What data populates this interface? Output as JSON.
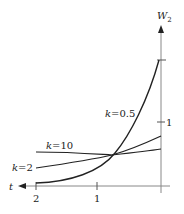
{
  "figure": {
    "y_axis_label": "W",
    "y_axis_subscript": "2",
    "x_axis_label": "t",
    "x_ticks": [
      "2",
      "1"
    ],
    "y_ticks": [
      "1"
    ],
    "curves": [
      {
        "name": "k=0.5",
        "k_label": "k",
        "value_label": "=0.5"
      },
      {
        "name": "k=10",
        "k_label": "k",
        "value_label": "=10"
      },
      {
        "name": "k=2",
        "k_label": "k",
        "value_label": "=2"
      }
    ],
    "colors": {
      "curve": "#222222",
      "axis": "#888888"
    }
  }
}
